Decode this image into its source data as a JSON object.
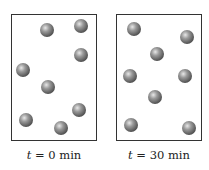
{
  "panels": [
    {
      "label_var": "t",
      "label_rest": " = 0 min",
      "box": {
        "left": 11,
        "top": 14,
        "width": 86,
        "height": 127
      },
      "molecules": [
        [
          47,
          30
        ],
        [
          81,
          26
        ],
        [
          81,
          55
        ],
        [
          23,
          70
        ],
        [
          48,
          87
        ],
        [
          26,
          120
        ],
        [
          79,
          110
        ],
        [
          61,
          128
        ]
      ]
    },
    {
      "label_var": "t",
      "label_rest": " = 30 min",
      "box": {
        "left": 116,
        "top": 14,
        "width": 86,
        "height": 127
      },
      "molecules": [
        [
          134,
          29
        ],
        [
          187,
          37
        ],
        [
          157,
          54
        ],
        [
          130,
          76
        ],
        [
          185,
          76
        ],
        [
          155,
          97
        ],
        [
          131,
          125
        ],
        [
          189,
          128
        ]
      ]
    }
  ],
  "colors": {
    "border": "#333333",
    "molecule": "#666666"
  }
}
